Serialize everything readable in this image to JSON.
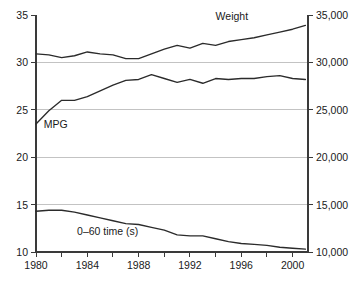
{
  "chart_data": {
    "type": "line",
    "title": "",
    "xlabel": "",
    "ylabel": "",
    "grid": "horizontal gridlines at left-axis values 15, 20, 25, 30",
    "legend_position": "inline labels next to each curve",
    "x": [
      1980,
      1981,
      1982,
      1983,
      1984,
      1985,
      1986,
      1987,
      1988,
      1989,
      1990,
      1991,
      1992,
      1993,
      1994,
      1995,
      1996,
      1997,
      1998,
      1999,
      2000,
      2001
    ],
    "left_axis": {
      "label": "",
      "ticks": [
        "10",
        "15",
        "20",
        "25",
        "30",
        "35"
      ],
      "min": 10,
      "max": 35
    },
    "right_axis": {
      "label": "",
      "ticks": [
        "10,000",
        "15,000",
        "20,000",
        "25,000",
        "30,000",
        "35,000"
      ],
      "min": 10000,
      "max": 35000
    },
    "x_axis": {
      "tick_labels": [
        "1980",
        "1984",
        "1988",
        "1992",
        "1996",
        "2000"
      ],
      "tick_label_values": [
        1980,
        1984,
        1988,
        1992,
        1996,
        2000
      ],
      "minor_tick_step": 2,
      "min": 1980,
      "max": 2001.2
    },
    "series": [
      {
        "name": "Weight",
        "label": "Weight",
        "axis": "right",
        "units": "lb",
        "values": [
          30900,
          30800,
          30500,
          30700,
          31100,
          30900,
          30800,
          30400,
          30400,
          30900,
          31400,
          31800,
          31500,
          32000,
          31800,
          32200,
          32400,
          32600,
          32900,
          33200,
          33500,
          33900
        ]
      },
      {
        "name": "MPG",
        "label": "MPG",
        "axis": "left",
        "units": "mpg",
        "values": [
          23.5,
          24.9,
          26.0,
          26.0,
          26.4,
          27.0,
          27.6,
          28.1,
          28.2,
          28.7,
          28.3,
          27.9,
          28.2,
          27.8,
          28.3,
          28.2,
          28.3,
          28.3,
          28.5,
          28.6,
          28.3,
          28.2
        ]
      },
      {
        "name": "0-60 time (s)",
        "label": "0–60 time (s)",
        "axis": "left",
        "units": "s",
        "values": [
          14.3,
          14.4,
          14.4,
          14.2,
          13.9,
          13.6,
          13.3,
          13.0,
          12.9,
          12.6,
          12.3,
          11.8,
          11.7,
          11.7,
          11.4,
          11.1,
          10.9,
          10.8,
          10.7,
          10.5,
          10.4,
          10.3
        ]
      }
    ],
    "annotations": [
      {
        "name": "weight-label",
        "text": "Weight",
        "x": 1994.0,
        "y_px": 20
      },
      {
        "name": "mpg-label",
        "text": "MPG",
        "x": 1980.6,
        "y_px": 128
      },
      {
        "name": "zero-sixty-label",
        "text": "0–60 time (s)",
        "x": 1983.2,
        "y_px": 235
      }
    ]
  },
  "colors": {
    "line": "#2b2b2b",
    "axis": "#3a3a3a",
    "grid": "#b4b4b4",
    "background": "#ffffff",
    "text": "#1a1a1a"
  }
}
